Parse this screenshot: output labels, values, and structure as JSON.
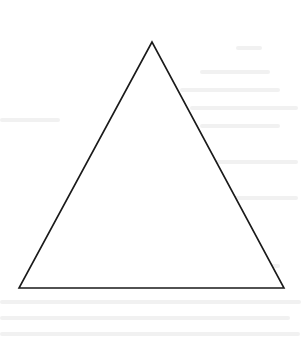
{
  "diagram": {
    "type": "triangle",
    "shape": "isosceles-triangle",
    "vertices": [
      {
        "name": "apex",
        "x": 152,
        "y": 42
      },
      {
        "name": "bottom-left",
        "x": 19,
        "y": 288
      },
      {
        "name": "bottom-right",
        "x": 284,
        "y": 288
      }
    ],
    "stroke_color": "#1a1a1a",
    "fill_color": "#ffffff",
    "background_color": "#ffffff",
    "labels": []
  }
}
